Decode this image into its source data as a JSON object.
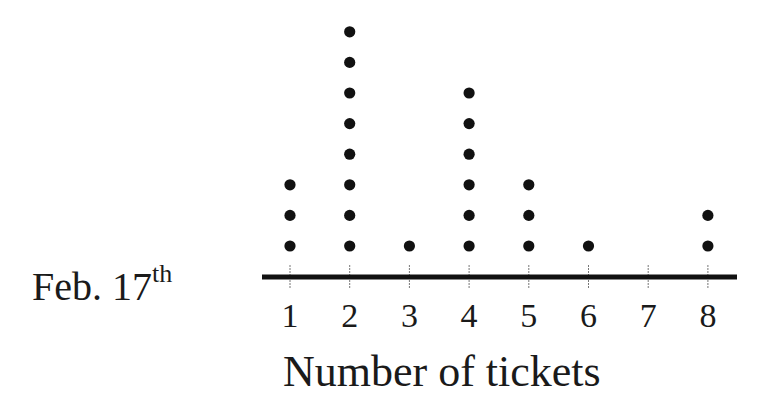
{
  "chart_data": {
    "type": "dot_plot",
    "title": "",
    "row_label": {
      "main": "Feb. 17",
      "superscript": "th"
    },
    "xlabel": "Number of tickets",
    "ylabel": "",
    "categories": [
      1,
      2,
      3,
      4,
      5,
      6,
      7,
      8
    ],
    "values": [
      3,
      8,
      1,
      6,
      3,
      1,
      0,
      2
    ],
    "total": 24,
    "xlim": [
      1,
      8
    ],
    "grid": false,
    "legend": null,
    "colors": {
      "dot": "#111111",
      "axis": "#111111",
      "tick": "#777777"
    }
  }
}
